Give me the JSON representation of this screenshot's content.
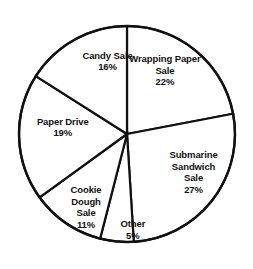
{
  "chart_data": {
    "type": "pie",
    "title": "",
    "subtitle": "",
    "xlabel": "",
    "ylabel": "",
    "legend_position": "none",
    "grid": false,
    "units": "percent",
    "total": 100,
    "start_angle_deg": 0,
    "direction": "clockwise",
    "categories": [
      "Wrapping Paper Sale",
      "Submarine Sandwich Sale",
      "Other",
      "Cookie Dough Sale",
      "Paper Drive",
      "Candy Sale"
    ],
    "values": [
      22,
      27,
      5,
      11,
      19,
      16
    ],
    "slices": [
      {
        "name": "Wrapping Paper Sale",
        "value": 22,
        "value_label": "22%",
        "label_lines": [
          "Wrapping Paper",
          "Sale"
        ],
        "label_x_pct": 65.2,
        "label_y_pct": 26.0,
        "color": "#ffffff"
      },
      {
        "name": "Submarine Sandwich Sale",
        "value": 27,
        "value_label": "27%",
        "label_lines": [
          "Submarine",
          "Sandwich",
          "Sale"
        ],
        "label_x_pct": 76.5,
        "label_y_pct": 64.0,
        "color": "#ffffff"
      },
      {
        "name": "Other",
        "value": 5,
        "value_label": "5%",
        "label_lines": [
          "Other"
        ],
        "label_x_pct": 52.5,
        "label_y_pct": 85.5,
        "color": "#ffffff"
      },
      {
        "name": "Cookie Dough Sale",
        "value": 11,
        "value_label": "11%",
        "label_lines": [
          "Cookie",
          "Dough",
          "Sale"
        ],
        "label_x_pct": 34.0,
        "label_y_pct": 77.0,
        "color": "#ffffff"
      },
      {
        "name": "Paper Drive",
        "value": 19,
        "value_label": "19%",
        "label_lines": [
          "Paper Drive"
        ],
        "label_x_pct": 24.8,
        "label_y_pct": 47.5,
        "color": "#ffffff"
      },
      {
        "name": "Candy Sale",
        "value": 16,
        "value_label": "16%",
        "label_lines": [
          "Candy Sale"
        ],
        "label_x_pct": 42.5,
        "label_y_pct": 23.0,
        "color": "#ffffff"
      }
    ],
    "geometry": {
      "center_x": 127,
      "center_y": 134,
      "radius": 108,
      "stroke_color": "#111111",
      "fill_color": "#ffffff",
      "background": "#ffffff"
    }
  }
}
